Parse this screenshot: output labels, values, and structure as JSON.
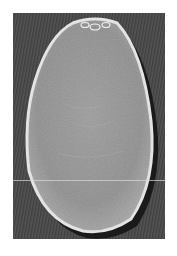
{
  "image": {
    "description": "Grayscale scanning electron micrograph of an elongated obovoid seed",
    "subject": "seed",
    "colors": {
      "background": "#ffffff",
      "panel": "#4a4a4a",
      "seed_surface": "#9a9a9a",
      "seed_rim": "#e8e8e8",
      "shadow": "#1a1a1a"
    }
  }
}
